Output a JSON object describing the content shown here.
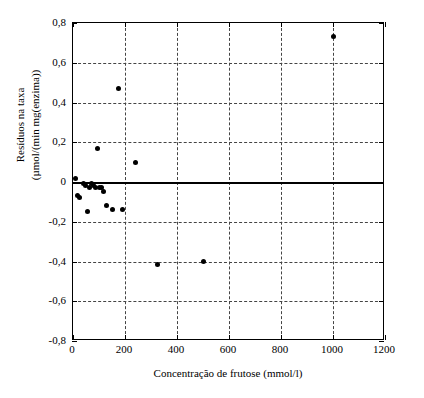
{
  "chart_data": {
    "type": "scatter",
    "title": "",
    "xlabel": "Concentração de frutose (mmol/l)",
    "ylabel_line1": "Resíduos na taxa",
    "ylabel_line2": "(µmol/(min mg(enzima))",
    "xlim": [
      0,
      1200
    ],
    "ylim": [
      -0.8,
      0.8
    ],
    "xticks": [
      0,
      200,
      400,
      600,
      800,
      1000,
      1200
    ],
    "xtick_labels": [
      "0",
      "200",
      "400",
      "600",
      "800",
      "1000",
      "1200"
    ],
    "yticks": [
      -0.8,
      -0.6,
      -0.4,
      -0.2,
      0.0,
      0.2,
      0.4,
      0.6,
      0.8
    ],
    "ytick_labels": [
      "-0,8",
      "-0,6",
      "-0,4",
      "-0,2",
      "0",
      "0,2",
      "0,4",
      "0,6",
      "0,8"
    ],
    "grid": "dashed-both",
    "zero_line": 0.0,
    "legend": "none",
    "marker": "filled-circle",
    "marker_color": "#000000",
    "points": [
      {
        "x": 10,
        "y": 0.02
      },
      {
        "x": 18,
        "y": -0.07
      },
      {
        "x": 25,
        "y": -0.08
      },
      {
        "x": 40,
        "y": -0.01
      },
      {
        "x": 48,
        "y": -0.02
      },
      {
        "x": 55,
        "y": -0.15
      },
      {
        "x": 62,
        "y": -0.03
      },
      {
        "x": 70,
        "y": -0.01
      },
      {
        "x": 78,
        "y": -0.02
      },
      {
        "x": 85,
        "y": -0.03
      },
      {
        "x": 95,
        "y": 0.17
      },
      {
        "x": 100,
        "y": -0.03
      },
      {
        "x": 108,
        "y": -0.03
      },
      {
        "x": 118,
        "y": -0.05
      },
      {
        "x": 128,
        "y": -0.12
      },
      {
        "x": 150,
        "y": -0.14
      },
      {
        "x": 175,
        "y": 0.47
      },
      {
        "x": 190,
        "y": -0.14
      },
      {
        "x": 240,
        "y": 0.1
      },
      {
        "x": 325,
        "y": -0.415
      },
      {
        "x": 500,
        "y": -0.4
      },
      {
        "x": 1000,
        "y": 0.73
      }
    ]
  }
}
